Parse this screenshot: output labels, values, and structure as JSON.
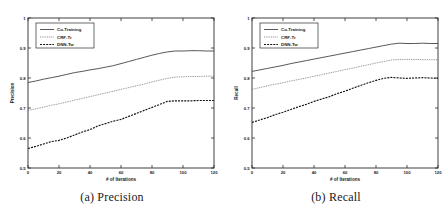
{
  "figure": {
    "panels": [
      {
        "id": "precision",
        "caption": "(a) Precision"
      },
      {
        "id": "recall",
        "caption": "(b) Recall"
      }
    ]
  },
  "chart_data": [
    {
      "type": "line",
      "title": "",
      "panel_caption": "(a) Precision",
      "xlabel": "# of Iterations",
      "ylabel": "Precision",
      "xlim": [
        0,
        120
      ],
      "ylim": [
        0.5,
        1.0
      ],
      "xticks": [
        0,
        20,
        40,
        60,
        80,
        100,
        120
      ],
      "xticklabels": [
        "0",
        "20",
        "40",
        "60",
        "80",
        "100",
        "120"
      ],
      "yticks": [
        0.5,
        0.6,
        0.7,
        0.8,
        0.9,
        1.0
      ],
      "yticklabels": [
        "0.5",
        "0.6",
        "0.7",
        "0.8",
        "0.9",
        "1"
      ],
      "grid": false,
      "legend_position": "upper left",
      "x": [
        0,
        5,
        10,
        15,
        20,
        25,
        30,
        35,
        40,
        45,
        50,
        55,
        60,
        65,
        70,
        75,
        80,
        85,
        90,
        95,
        100,
        105,
        110,
        115,
        120
      ],
      "series": [
        {
          "name": "Co-Training",
          "style": "solid",
          "values": [
            0.785,
            0.79,
            0.796,
            0.801,
            0.806,
            0.812,
            0.818,
            0.822,
            0.827,
            0.831,
            0.836,
            0.841,
            0.848,
            0.855,
            0.862,
            0.869,
            0.876,
            0.882,
            0.887,
            0.89,
            0.89,
            0.891,
            0.891,
            0.89,
            0.89
          ]
        },
        {
          "name": "CRF-Tr",
          "style": "dotted",
          "values": [
            0.692,
            0.697,
            0.703,
            0.709,
            0.714,
            0.72,
            0.726,
            0.732,
            0.738,
            0.744,
            0.75,
            0.756,
            0.762,
            0.768,
            0.774,
            0.78,
            0.787,
            0.793,
            0.799,
            0.803,
            0.804,
            0.805,
            0.805,
            0.806,
            0.806
          ]
        },
        {
          "name": "DNN-Tw",
          "style": "dashed",
          "values": [
            0.565,
            0.572,
            0.58,
            0.588,
            0.592,
            0.6,
            0.61,
            0.62,
            0.628,
            0.64,
            0.648,
            0.656,
            0.662,
            0.672,
            0.682,
            0.692,
            0.702,
            0.712,
            0.722,
            0.724,
            0.724,
            0.724,
            0.725,
            0.725,
            0.725
          ]
        }
      ]
    },
    {
      "type": "line",
      "title": "",
      "panel_caption": "(b) Recall",
      "xlabel": "# of Iterations",
      "ylabel": "Recall",
      "xlim": [
        0,
        120
      ],
      "ylim": [
        0.5,
        1.0
      ],
      "xticks": [
        0,
        20,
        40,
        60,
        80,
        100,
        120
      ],
      "xticklabels": [
        "0",
        "20",
        "40",
        "60",
        "80",
        "100",
        "120"
      ],
      "yticks": [
        0.5,
        0.6,
        0.7,
        0.8,
        0.9,
        1.0
      ],
      "yticklabels": [
        "0.5",
        "0.6",
        "0.7",
        "0.8",
        "0.9",
        "1"
      ],
      "grid": false,
      "legend_position": "upper left",
      "x": [
        0,
        5,
        10,
        15,
        20,
        25,
        30,
        35,
        40,
        45,
        50,
        55,
        60,
        65,
        70,
        75,
        80,
        85,
        90,
        95,
        100,
        105,
        110,
        115,
        120
      ],
      "series": [
        {
          "name": "Co-Training",
          "style": "solid",
          "values": [
            0.822,
            0.827,
            0.832,
            0.837,
            0.842,
            0.848,
            0.853,
            0.858,
            0.863,
            0.868,
            0.873,
            0.878,
            0.883,
            0.888,
            0.893,
            0.898,
            0.903,
            0.908,
            0.913,
            0.916,
            0.915,
            0.915,
            0.916,
            0.915,
            0.915
          ]
        },
        {
          "name": "CRF-Tr",
          "style": "dotted",
          "values": [
            0.762,
            0.768,
            0.774,
            0.779,
            0.784,
            0.79,
            0.795,
            0.8,
            0.806,
            0.811,
            0.817,
            0.822,
            0.828,
            0.833,
            0.839,
            0.844,
            0.85,
            0.855,
            0.86,
            0.862,
            0.862,
            0.862,
            0.861,
            0.861,
            0.861
          ]
        },
        {
          "name": "DNN-Tw",
          "style": "dashed",
          "values": [
            0.652,
            0.66,
            0.668,
            0.678,
            0.686,
            0.695,
            0.704,
            0.712,
            0.722,
            0.73,
            0.738,
            0.748,
            0.756,
            0.766,
            0.775,
            0.784,
            0.792,
            0.799,
            0.802,
            0.8,
            0.799,
            0.8,
            0.801,
            0.8,
            0.799
          ]
        }
      ]
    }
  ]
}
